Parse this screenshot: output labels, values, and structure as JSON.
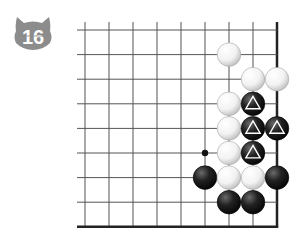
{
  "problem": {
    "number": "16",
    "badge_color": "#8c8c8c",
    "badge_text_color": "#ffffff"
  },
  "board": {
    "columns": 9,
    "rows": 9,
    "origin_x": 85,
    "origin_y": 30,
    "spacing_x": 24,
    "spacing_y": 24.6,
    "edges": [
      "right",
      "bottom"
    ],
    "line_color": "#555555",
    "edge_color": "#222222"
  },
  "stones": [
    {
      "color": "white",
      "col": 6,
      "row": 1,
      "mark": ""
    },
    {
      "color": "white",
      "col": 7,
      "row": 2,
      "mark": ""
    },
    {
      "color": "white",
      "col": 8,
      "row": 2,
      "mark": ""
    },
    {
      "color": "white",
      "col": 6,
      "row": 3,
      "mark": ""
    },
    {
      "color": "black",
      "col": 7,
      "row": 3,
      "mark": "triangle"
    },
    {
      "color": "white",
      "col": 6,
      "row": 4,
      "mark": ""
    },
    {
      "color": "black",
      "col": 7,
      "row": 4,
      "mark": "triangle"
    },
    {
      "color": "black",
      "col": 8,
      "row": 4,
      "mark": "triangle"
    },
    {
      "color": "white",
      "col": 6,
      "row": 5,
      "mark": ""
    },
    {
      "color": "black",
      "col": 7,
      "row": 5,
      "mark": "triangle"
    },
    {
      "color": "black",
      "col": 5,
      "row": 6,
      "mark": ""
    },
    {
      "color": "white",
      "col": 6,
      "row": 6,
      "mark": ""
    },
    {
      "color": "white",
      "col": 7,
      "row": 6,
      "mark": ""
    },
    {
      "color": "black",
      "col": 8,
      "row": 6,
      "mark": ""
    },
    {
      "color": "black",
      "col": 6,
      "row": 7,
      "mark": ""
    },
    {
      "color": "black",
      "col": 7,
      "row": 7,
      "mark": ""
    }
  ],
  "markers": [
    {
      "type": "dot",
      "col": 5,
      "row": 5
    }
  ]
}
